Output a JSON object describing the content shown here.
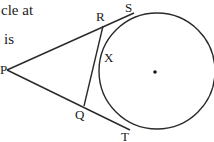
{
  "question_fragment": {
    "line1": "cle at",
    "line2": "is"
  },
  "diagram": {
    "labels": {
      "P": "P",
      "R": "R",
      "S": "S",
      "X": "X",
      "Q": "Q",
      "T": "T"
    },
    "circle": {
      "cx": 157,
      "cy": 71,
      "r": 58
    },
    "center_dot": {
      "x": 155,
      "y": 72
    },
    "points": {
      "P": [
        7,
        70
      ],
      "S": [
        129,
        15
      ],
      "T": [
        124,
        127
      ],
      "R": [
        101,
        27
      ],
      "Q": [
        84,
        105
      ],
      "X": [
        99,
        66
      ]
    },
    "stroke_color": "#2a2a2a"
  }
}
